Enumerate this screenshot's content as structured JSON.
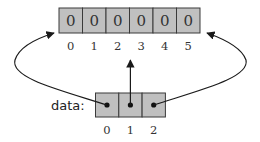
{
  "top_array": {
    "values": [
      "0",
      "0",
      "0",
      "0",
      "0",
      "0"
    ],
    "indices": [
      "0",
      "1",
      "2",
      "3",
      "4",
      "5"
    ]
  },
  "data_array": {
    "label": "data:",
    "indices": [
      "0",
      "1",
      "2"
    ],
    "cells": [
      "pointer",
      "pointer",
      "pointer"
    ]
  },
  "colors": {
    "cell_fill": "#c0c0c0",
    "cell_border": "#3a3a3a",
    "arrow": "#1a1a1a"
  }
}
